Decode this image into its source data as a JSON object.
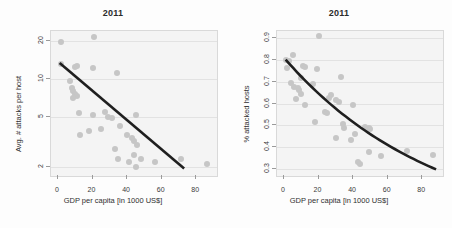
{
  "figure": {
    "background": "#fdfdfd",
    "point_color": "#c6c6c6",
    "trend_color": "#1f1f1f",
    "panel_bg": "#f4f4f4",
    "grid_color": "#e2e2e2"
  },
  "chart_data": [
    {
      "type": "scatter",
      "panel": "left",
      "title": "2011",
      "xlabel": "GDP per capita [in 1000 US$]",
      "ylabel": "Avg. # attacks per host",
      "xlim": [
        -4,
        92
      ],
      "ylim": [
        1.7,
        24
      ],
      "yscale": "log",
      "xscale": "linear",
      "xticks": [
        0,
        20,
        40,
        60,
        80
      ],
      "yticks": [
        2,
        5,
        10,
        20
      ],
      "grid": true,
      "legend": "none",
      "points": [
        {
          "x": 2,
          "y": 19.5
        },
        {
          "x": 21,
          "y": 21.5
        },
        {
          "x": 2,
          "y": 13.2
        },
        {
          "x": 10,
          "y": 12.5
        },
        {
          "x": 11,
          "y": 12.6
        },
        {
          "x": 20,
          "y": 12.3
        },
        {
          "x": 34,
          "y": 11.2
        },
        {
          "x": 7,
          "y": 9.6
        },
        {
          "x": 8,
          "y": 8.4
        },
        {
          "x": 9,
          "y": 8.0
        },
        {
          "x": 10,
          "y": 7.6
        },
        {
          "x": 11,
          "y": 7.3
        },
        {
          "x": 9,
          "y": 7.0
        },
        {
          "x": 12,
          "y": 5.4
        },
        {
          "x": 20,
          "y": 5.2
        },
        {
          "x": 29,
          "y": 5.0
        },
        {
          "x": 31,
          "y": 4.9
        },
        {
          "x": 45,
          "y": 5.2
        },
        {
          "x": 27,
          "y": 5.5
        },
        {
          "x": 18,
          "y": 3.9
        },
        {
          "x": 25,
          "y": 4.0
        },
        {
          "x": 36,
          "y": 4.2
        },
        {
          "x": 13,
          "y": 3.6
        },
        {
          "x": 40,
          "y": 3.6
        },
        {
          "x": 43,
          "y": 3.4
        },
        {
          "x": 44,
          "y": 3.2
        },
        {
          "x": 46,
          "y": 3.0
        },
        {
          "x": 33,
          "y": 2.8
        },
        {
          "x": 44,
          "y": 2.5
        },
        {
          "x": 35,
          "y": 2.3
        },
        {
          "x": 41,
          "y": 2.2
        },
        {
          "x": 48,
          "y": 2.3
        },
        {
          "x": 56,
          "y": 2.2
        },
        {
          "x": 45,
          "y": 2.0
        },
        {
          "x": 71,
          "y": 2.3
        },
        {
          "x": 86,
          "y": 2.1
        }
      ],
      "trendline": {
        "x0": 1,
        "y0": 13.4,
        "x1": 73,
        "y1": 1.95,
        "style": "log-linear"
      }
    },
    {
      "type": "scatter",
      "panel": "right",
      "title": "2011",
      "xlabel": "GDP per capita [in 1000 US$]",
      "ylabel": "% attacked hosts",
      "xlim": [
        -4,
        92
      ],
      "ylim": [
        0.27,
        0.93
      ],
      "yscale": "linear",
      "xscale": "linear",
      "xticks": [
        0,
        20,
        40,
        60,
        80
      ],
      "yticks": [
        0.3,
        0.4,
        0.5,
        0.6,
        0.7,
        0.8,
        0.9
      ],
      "grid": true,
      "legend": "none",
      "points": [
        {
          "x": 20,
          "y": 0.905
        },
        {
          "x": 5,
          "y": 0.82
        },
        {
          "x": 1,
          "y": 0.8
        },
        {
          "x": 3,
          "y": 0.795
        },
        {
          "x": 11,
          "y": 0.77
        },
        {
          "x": 12,
          "y": 0.765
        },
        {
          "x": 2,
          "y": 0.76
        },
        {
          "x": 19,
          "y": 0.755
        },
        {
          "x": 10,
          "y": 0.715
        },
        {
          "x": 33,
          "y": 0.72
        },
        {
          "x": 17,
          "y": 0.69
        },
        {
          "x": 4,
          "y": 0.695
        },
        {
          "x": 6,
          "y": 0.675
        },
        {
          "x": 8,
          "y": 0.67
        },
        {
          "x": 9,
          "y": 0.66
        },
        {
          "x": 10,
          "y": 0.645
        },
        {
          "x": 27,
          "y": 0.64
        },
        {
          "x": 30,
          "y": 0.615
        },
        {
          "x": 32,
          "y": 0.605
        },
        {
          "x": 26,
          "y": 0.625
        },
        {
          "x": 40,
          "y": 0.595
        },
        {
          "x": 12,
          "y": 0.595
        },
        {
          "x": 7,
          "y": 0.62
        },
        {
          "x": 24,
          "y": 0.56
        },
        {
          "x": 25,
          "y": 0.555
        },
        {
          "x": 18,
          "y": 0.515
        },
        {
          "x": 34,
          "y": 0.505
        },
        {
          "x": 35,
          "y": 0.49
        },
        {
          "x": 47,
          "y": 0.495
        },
        {
          "x": 49,
          "y": 0.49
        },
        {
          "x": 50,
          "y": 0.485
        },
        {
          "x": 41,
          "y": 0.46
        },
        {
          "x": 30,
          "y": 0.445
        },
        {
          "x": 39,
          "y": 0.435
        },
        {
          "x": 43,
          "y": 0.335
        },
        {
          "x": 44,
          "y": 0.325
        },
        {
          "x": 49,
          "y": 0.38
        },
        {
          "x": 56,
          "y": 0.36
        },
        {
          "x": 71,
          "y": 0.385
        },
        {
          "x": 86,
          "y": 0.365
        }
      ],
      "trendline": {
        "x0": 1,
        "y0": 0.8,
        "x1": 88,
        "y1": 0.3,
        "style": "exponential-decay"
      }
    }
  ]
}
